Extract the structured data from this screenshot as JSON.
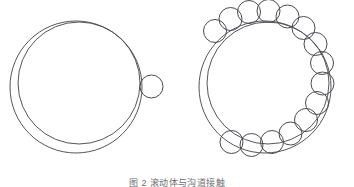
{
  "figure": {
    "caption": "图 2   滚动体与沟道接触",
    "caption_visible_fraction": "top sliver only, clipped by image bottom edge",
    "background_color": "#ffffff",
    "stroke_color": "#55555a",
    "ball_stroke_color": "#4a4a50",
    "stroke_width": 1,
    "canvas": {
      "width": 354,
      "height": 187
    },
    "panels": [
      {
        "id": "left-panel",
        "name": "single-ball-ring",
        "label": "(a)",
        "outer_circle": {
          "cx": 76,
          "cy": 87,
          "r": 66
        },
        "inner_circle": {
          "cx": 79,
          "cy": 83,
          "r": 61
        },
        "ball_radius": 11.5,
        "ball_count": 1,
        "balls": [
          {
            "cx": 151.5,
            "cy": 86.5,
            "r": 11.5
          }
        ]
      },
      {
        "id": "right-panel",
        "name": "full-ball-complement-ring",
        "label": "(b)",
        "outer_circle": {
          "cx": 265,
          "cy": 87,
          "r": 66
        },
        "inner_circle": {
          "cx": 268,
          "cy": 83,
          "r": 61
        },
        "ball_radius": 11.5,
        "ball_count": 15,
        "balls": [
          {
            "cx": 215.0,
            "cy": 31.0,
            "r": 11.5
          },
          {
            "cx": 230.5,
            "cy": 19.0,
            "r": 11.5
          },
          {
            "cx": 249.0,
            "cy": 12.0,
            "r": 11.5
          },
          {
            "cx": 268.5,
            "cy": 11.0,
            "r": 11.5
          },
          {
            "cx": 287.5,
            "cy": 16.5,
            "r": 11.5
          },
          {
            "cx": 303.5,
            "cy": 28.0,
            "r": 11.5
          },
          {
            "cx": 315.5,
            "cy": 44.0,
            "r": 11.5
          },
          {
            "cx": 322.0,
            "cy": 63.0,
            "r": 11.5
          },
          {
            "cx": 322.5,
            "cy": 83.5,
            "r": 11.5
          },
          {
            "cx": 317.0,
            "cy": 103.0,
            "r": 11.5
          },
          {
            "cx": 306.0,
            "cy": 120.0,
            "r": 11.5
          },
          {
            "cx": 290.5,
            "cy": 133.5,
            "r": 11.5
          },
          {
            "cx": 272.0,
            "cy": 142.0,
            "r": 11.5
          },
          {
            "cx": 251.5,
            "cy": 145.0,
            "r": 11.5
          },
          {
            "cx": 231.5,
            "cy": 142.0,
            "r": 11.5
          }
        ]
      }
    ]
  }
}
